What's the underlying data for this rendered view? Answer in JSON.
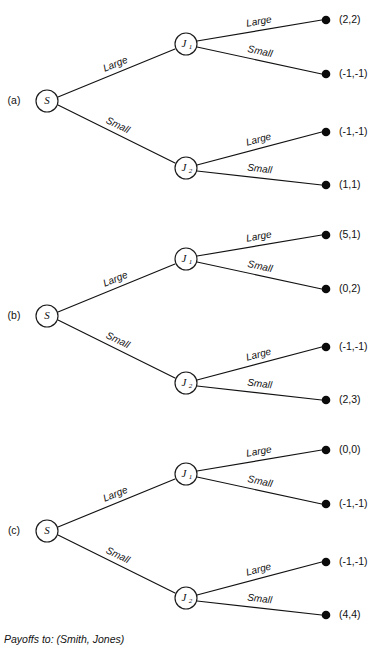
{
  "figure": {
    "caption": "Payoffs to: (Smith, Jones)",
    "root_node_label": "S",
    "second_node_labels": {
      "upper": "J",
      "lower": "J"
    },
    "second_node_subscripts": {
      "upper": "1",
      "lower": "2"
    },
    "branch_labels": {
      "large": "Large",
      "small": "Small"
    },
    "panels": [
      {
        "id": "a",
        "panel_label": "(a)",
        "payoffs": [
          "(2,2)",
          "(-1,-1)",
          "(-1,-1)",
          "(1,1)"
        ]
      },
      {
        "id": "b",
        "panel_label": "(b)",
        "payoffs": [
          "(5,1)",
          "(0,2)",
          "(-1,-1)",
          "(2,3)"
        ]
      },
      {
        "id": "c",
        "panel_label": "(c)",
        "payoffs": [
          "(0,0)",
          "(-1,-1)",
          "(-1,-1)",
          "(4,4)"
        ]
      }
    ]
  },
  "chart_data": {
    "type": "diagram",
    "caption": "Payoffs to: (Smith, Jones)",
    "players": [
      "Smith",
      "Jones"
    ],
    "actions": [
      "Large",
      "Small"
    ],
    "nodes": [
      "S",
      "J1",
      "J2"
    ],
    "trees": [
      {
        "panel": "(a)",
        "root": "S",
        "paths": [
          {
            "smith": "Large",
            "jones": "Large",
            "payoff": [
              2,
              2
            ],
            "label": "(2,2)"
          },
          {
            "smith": "Large",
            "jones": "Small",
            "payoff": [
              -1,
              -1
            ],
            "label": "(-1,-1)"
          },
          {
            "smith": "Small",
            "jones": "Large",
            "payoff": [
              -1,
              -1
            ],
            "label": "(-1,-1)"
          },
          {
            "smith": "Small",
            "jones": "Small",
            "payoff": [
              1,
              1
            ],
            "label": "(1,1)"
          }
        ]
      },
      {
        "panel": "(b)",
        "root": "S",
        "paths": [
          {
            "smith": "Large",
            "jones": "Large",
            "payoff": [
              5,
              1
            ],
            "label": "(5,1)"
          },
          {
            "smith": "Large",
            "jones": "Small",
            "payoff": [
              0,
              2
            ],
            "label": "(0,2)"
          },
          {
            "smith": "Small",
            "jones": "Large",
            "payoff": [
              -1,
              -1
            ],
            "label": "(-1,-1)"
          },
          {
            "smith": "Small",
            "jones": "Small",
            "payoff": [
              2,
              3
            ],
            "label": "(2,3)"
          }
        ]
      },
      {
        "panel": "(c)",
        "root": "S",
        "paths": [
          {
            "smith": "Large",
            "jones": "Large",
            "payoff": [
              0,
              0
            ],
            "label": "(0,0)"
          },
          {
            "smith": "Large",
            "jones": "Small",
            "payoff": [
              -1,
              -1
            ],
            "label": "(-1,-1)"
          },
          {
            "smith": "Small",
            "jones": "Large",
            "payoff": [
              -1,
              -1
            ],
            "label": "(-1,-1)"
          },
          {
            "smith": "Small",
            "jones": "Small",
            "payoff": [
              4,
              4
            ],
            "label": "(4,4)"
          }
        ]
      }
    ]
  }
}
